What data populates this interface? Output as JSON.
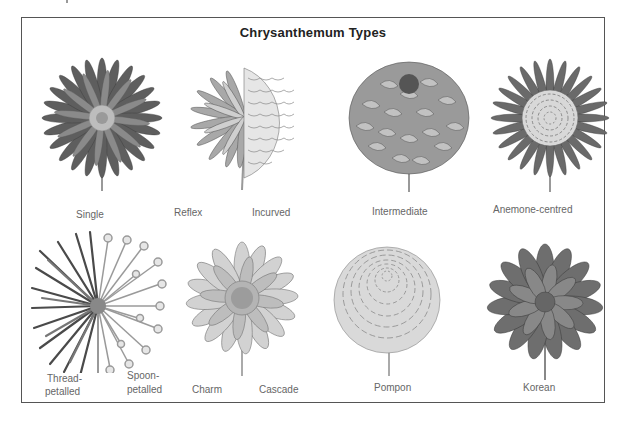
{
  "figure": {
    "title": "Chrysanthemum Types",
    "palette": {
      "ink": "#222222",
      "label": "#666666",
      "frame": "#555555",
      "petal_dark": "#5a5a5a",
      "petal_mid": "#8a8a8a",
      "petal_light": "#c8c8c8"
    }
  },
  "rows": [
    {
      "illustrations": [
        {
          "type": "single",
          "labels": [
            "Single"
          ]
        },
        {
          "type": "reflex-incurved",
          "labels": [
            "Reflex",
            "Incurved"
          ]
        },
        {
          "type": "intermediate",
          "labels": [
            "Intermediate"
          ]
        },
        {
          "type": "anemone-centred",
          "labels": [
            "Anemone-centred"
          ]
        }
      ]
    },
    {
      "illustrations": [
        {
          "type": "thread-spoon",
          "labels": [
            "Thread-",
            "petalled",
            "Spoon-",
            "petalled"
          ]
        },
        {
          "type": "charm-cascade",
          "labels": [
            "Charm",
            "Cascade"
          ]
        },
        {
          "type": "pompon",
          "labels": [
            "Pompon"
          ]
        },
        {
          "type": "korean",
          "labels": [
            "Korean"
          ]
        }
      ]
    }
  ]
}
